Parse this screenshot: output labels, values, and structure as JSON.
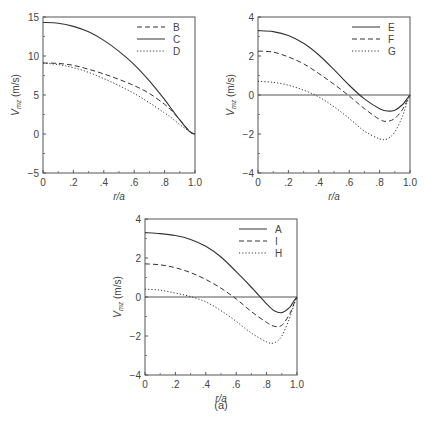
{
  "figure": {
    "caption": "(a)"
  },
  "chart_data": [
    {
      "type": "line",
      "title": "",
      "xlabel": "r/a",
      "ylabel": "V_mz (m/s)",
      "ylabel_main": "V",
      "ylabel_sub": "mz",
      "ylabel_unit": " (m/s)",
      "xlim": [
        0,
        1.0
      ],
      "ylim": [
        -5,
        15
      ],
      "xticks": [
        0,
        0.2,
        0.4,
        0.6,
        0.8,
        1.0
      ],
      "xtick_labels": [
        "0",
        ".2",
        ".4",
        ".6",
        ".8",
        "1.0"
      ],
      "yticks": [
        -5,
        0,
        5,
        10,
        15
      ],
      "ytick_labels": [
        "−5",
        "0",
        "5",
        "10",
        "15"
      ],
      "zero_line": false,
      "grid": false,
      "legend_position": "upper right",
      "box": {
        "x": 43,
        "y": 17,
        "w": 152,
        "h": 156
      },
      "x": [
        0,
        0.1,
        0.2,
        0.3,
        0.4,
        0.5,
        0.6,
        0.7,
        0.8,
        0.85,
        0.9,
        0.95,
        0.98,
        1.0
      ],
      "series": [
        {
          "name": "B",
          "style": "dashed",
          "values": [
            9.1,
            9.05,
            8.8,
            8.3,
            7.7,
            7.0,
            6.2,
            5.2,
            3.8,
            2.9,
            1.8,
            0.7,
            0.15,
            0
          ]
        },
        {
          "name": "C",
          "style": "solid",
          "values": [
            14.3,
            14.2,
            13.8,
            13.1,
            12.0,
            10.6,
            8.9,
            6.8,
            4.4,
            3.1,
            1.8,
            0.6,
            0.1,
            0
          ]
        },
        {
          "name": "D",
          "style": "dotted",
          "values": [
            9.1,
            8.9,
            8.5,
            7.9,
            7.1,
            6.2,
            5.2,
            4.0,
            2.7,
            2.0,
            1.2,
            0.5,
            0.1,
            0
          ]
        }
      ]
    },
    {
      "type": "line",
      "title": "",
      "xlabel": "r/a",
      "ylabel": "V_mz (m/s)",
      "ylabel_main": "V",
      "ylabel_sub": "mz",
      "ylabel_unit": " (m/s)",
      "xlim": [
        0,
        1.0
      ],
      "ylim": [
        -4,
        4
      ],
      "xticks": [
        0,
        0.2,
        0.4,
        0.6,
        0.8,
        1.0
      ],
      "xtick_labels": [
        "0",
        ".2",
        ".4",
        ".6",
        ".8",
        "1.0"
      ],
      "yticks": [
        -4,
        -2,
        0,
        2,
        4
      ],
      "ytick_labels": [
        "−4",
        "−2",
        "0",
        "2",
        "4"
      ],
      "zero_line": true,
      "grid": false,
      "legend_position": "upper right",
      "box": {
        "x": 258,
        "y": 17,
        "w": 152,
        "h": 156
      },
      "x": [
        0,
        0.1,
        0.2,
        0.3,
        0.4,
        0.5,
        0.6,
        0.7,
        0.8,
        0.85,
        0.9,
        0.95,
        0.98,
        1.0
      ],
      "series": [
        {
          "name": "E",
          "style": "solid",
          "values": [
            3.3,
            3.25,
            3.05,
            2.65,
            2.05,
            1.3,
            0.5,
            -0.2,
            -0.7,
            -0.82,
            -0.78,
            -0.5,
            -0.2,
            0
          ]
        },
        {
          "name": "F",
          "style": "dashed",
          "values": [
            2.25,
            2.2,
            1.95,
            1.6,
            1.1,
            0.55,
            -0.05,
            -0.7,
            -1.25,
            -1.35,
            -1.2,
            -0.75,
            -0.3,
            0
          ]
        },
        {
          "name": "G",
          "style": "dotted",
          "values": [
            0.7,
            0.65,
            0.5,
            0.25,
            -0.1,
            -0.6,
            -1.2,
            -1.85,
            -2.25,
            -2.25,
            -1.9,
            -1.1,
            -0.4,
            0
          ]
        }
      ]
    },
    {
      "type": "line",
      "title": "",
      "xlabel": "r/a",
      "ylabel": "V_mz (m/s)",
      "ylabel_main": "V",
      "ylabel_sub": "mz",
      "ylabel_unit": " (m/s)",
      "xlim": [
        0,
        1.0
      ],
      "ylim": [
        -4,
        4
      ],
      "xticks": [
        0,
        0.2,
        0.4,
        0.6,
        0.8,
        1.0
      ],
      "xtick_labels": [
        "0",
        ".2",
        ".4",
        ".6",
        ".8",
        "1.0"
      ],
      "yticks": [
        -4,
        -2,
        0,
        2,
        4
      ],
      "ytick_labels": [
        "−4",
        "−2",
        "0",
        "2",
        "4"
      ],
      "zero_line": true,
      "grid": false,
      "legend_position": "upper right",
      "box": {
        "x": 145,
        "y": 219,
        "w": 152,
        "h": 156
      },
      "x": [
        0,
        0.1,
        0.2,
        0.3,
        0.4,
        0.5,
        0.6,
        0.7,
        0.8,
        0.85,
        0.9,
        0.95,
        0.98,
        1.0
      ],
      "series": [
        {
          "name": "A",
          "style": "solid",
          "values": [
            3.3,
            3.25,
            3.15,
            2.95,
            2.6,
            2.05,
            1.3,
            0.5,
            -0.35,
            -0.7,
            -0.8,
            -0.55,
            -0.2,
            0
          ]
        },
        {
          "name": "I",
          "style": "dashed",
          "values": [
            1.7,
            1.65,
            1.5,
            1.25,
            0.9,
            0.45,
            -0.1,
            -0.75,
            -1.3,
            -1.5,
            -1.45,
            -0.9,
            -0.35,
            0
          ]
        },
        {
          "name": "H",
          "style": "dotted",
          "values": [
            0.4,
            0.35,
            0.2,
            0.02,
            -0.25,
            -0.7,
            -1.25,
            -1.85,
            -2.3,
            -2.35,
            -2.0,
            -1.1,
            -0.4,
            0
          ]
        }
      ]
    }
  ]
}
